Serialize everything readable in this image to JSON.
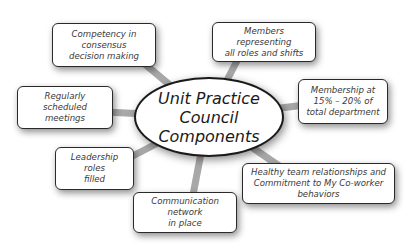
{
  "diagram": {
    "type": "hub-and-spoke",
    "center": {
      "label": "Unit Practice\nCouncil Components"
    },
    "components": [
      {
        "id": "competency",
        "label": "Competency in consensus\ndecision making"
      },
      {
        "id": "members",
        "label": "Members representing\nall roles and shifts"
      },
      {
        "id": "membership",
        "label": "Membership at\n15% – 20% of\ntotal department"
      },
      {
        "id": "meetings",
        "label": "Regularly scheduled\nmeetings"
      },
      {
        "id": "leadership",
        "label": "Leadership roles\nfilled"
      },
      {
        "id": "relationships",
        "label": "Healthy team relationships and\nCommitment to My Co-worker behaviors"
      },
      {
        "id": "communication",
        "label": "Communication network\nin place"
      }
    ],
    "colors": {
      "spoke": "#9a9a9a",
      "border": "#2a2a2a",
      "text": "#3a3a3a",
      "background": "#ffffff"
    }
  }
}
